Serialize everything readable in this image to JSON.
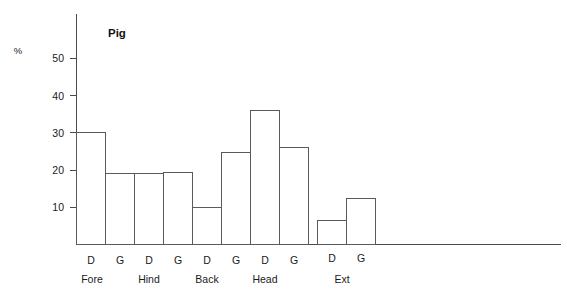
{
  "chart_data": {
    "type": "bar",
    "title": "Pig",
    "xlabel": "",
    "ylabel": "%",
    "ylim": [
      0,
      57
    ],
    "yticks": [
      10,
      20,
      30,
      40,
      50
    ],
    "ytick_labels": [
      "10",
      "20",
      "30",
      "40",
      "50"
    ],
    "grid": false,
    "legend": "none",
    "categories": [
      "Fore",
      "Hind",
      "Back",
      "Head",
      "Ext"
    ],
    "subcategories": [
      "D",
      "G"
    ],
    "bars": [
      {
        "group": "Fore",
        "sub": "D",
        "value": 30.0
      },
      {
        "group": "Fore",
        "sub": "G",
        "value": 19.0
      },
      {
        "group": "Hind",
        "sub": "D",
        "value": 19.0
      },
      {
        "group": "Hind",
        "sub": "G",
        "value": 19.4
      },
      {
        "group": "Back",
        "sub": "D",
        "value": 10.0
      },
      {
        "group": "Back",
        "sub": "G",
        "value": 24.7
      },
      {
        "group": "Head",
        "sub": "D",
        "value": 36.0
      },
      {
        "group": "Head",
        "sub": "G",
        "value": 26.0
      },
      {
        "group": "Ext",
        "sub": "D",
        "value": 6.5
      },
      {
        "group": "Ext",
        "sub": "G",
        "value": 12.4
      }
    ],
    "series": [
      {
        "name": "D",
        "values": [
          30.0,
          19.0,
          10.0,
          36.0,
          6.5
        ]
      },
      {
        "name": "G",
        "values": [
          19.0,
          19.4,
          24.7,
          26.0,
          12.4
        ]
      }
    ],
    "colors": {
      "bar_fill": "#ffffff",
      "bar_stroke": "#5a5a5a",
      "axis": "#4a4a4a",
      "text": "#1a1a1a"
    }
  }
}
